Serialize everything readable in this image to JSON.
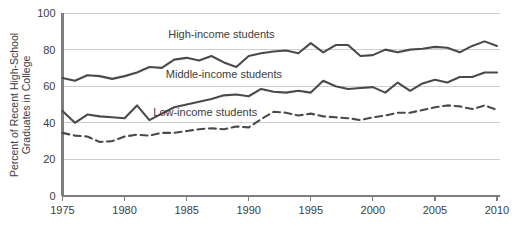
{
  "chart_data": {
    "type": "line",
    "title": "",
    "subtitle": "",
    "xlabel": "",
    "ylabel": "Percent of Recent High-School Graduates in College",
    "xlim": [
      1975,
      2010
    ],
    "ylim": [
      0,
      100
    ],
    "grid": true,
    "grid_axis": "y",
    "legend_position": "inline-annotations",
    "x_ticks": [
      1975,
      1980,
      1985,
      1990,
      1995,
      2000,
      2005,
      2010
    ],
    "x_tick_labels": [
      "1975",
      "1980",
      "1985",
      "1990",
      "1995",
      "2000",
      "2005",
      "2010"
    ],
    "y_ticks": [
      0,
      20,
      40,
      60,
      80,
      100
    ],
    "y_tick_labels": [
      "0",
      "20",
      "40",
      "60",
      "80",
      "100"
    ],
    "x": [
      1975,
      1976,
      1977,
      1978,
      1979,
      1980,
      1981,
      1982,
      1983,
      1984,
      1985,
      1986,
      1987,
      1988,
      1989,
      1990,
      1991,
      1992,
      1993,
      1994,
      1995,
      1996,
      1997,
      1998,
      1999,
      2000,
      2001,
      2002,
      2003,
      2004,
      2005,
      2006,
      2007,
      2008,
      2009,
      2010
    ],
    "series": [
      {
        "name": "High-income students",
        "label": "High-income students",
        "style": "solid",
        "color": "#4a4a4a",
        "label_x": 1987.8,
        "label_y": 88.5,
        "values": [
          64.5,
          63.0,
          66.0,
          65.5,
          64.0,
          65.5,
          67.5,
          70.5,
          70.0,
          74.5,
          75.5,
          74.0,
          76.5,
          73.0,
          70.5,
          76.5,
          78.0,
          79.0,
          79.5,
          78.0,
          83.5,
          78.5,
          82.5,
          82.5,
          76.5,
          77.0,
          80.0,
          78.5,
          80.0,
          80.5,
          81.5,
          81.0,
          78.5,
          82.0,
          84.5,
          82.0
        ]
      },
      {
        "name": "Middle-income students",
        "label": "Middle-income students",
        "style": "solid",
        "color": "#4a4a4a",
        "label_x": 1988.0,
        "label_y": 66.5,
        "values": [
          46.5,
          40.0,
          44.5,
          43.5,
          43.0,
          42.5,
          49.5,
          41.5,
          45.0,
          48.5,
          50.0,
          51.5,
          53.0,
          55.0,
          55.5,
          54.5,
          58.5,
          57.0,
          56.5,
          57.5,
          56.5,
          63.0,
          60.0,
          58.5,
          59.0,
          59.5,
          56.5,
          62.0,
          57.5,
          61.5,
          63.5,
          62.0,
          65.0,
          65.0,
          67.5,
          67.5
        ]
      },
      {
        "name": "Low-income students",
        "label": "Low-income students",
        "style": "dashed",
        "color": "#4a4a4a",
        "label_x": 1986.5,
        "label_y": 46.0,
        "values": [
          34.5,
          33.0,
          32.5,
          29.5,
          30.0,
          32.5,
          33.5,
          33.0,
          34.5,
          34.5,
          35.5,
          36.5,
          37.0,
          36.5,
          38.0,
          37.5,
          42.0,
          46.0,
          45.5,
          44.0,
          45.0,
          43.5,
          43.0,
          42.5,
          41.5,
          43.0,
          44.0,
          45.5,
          45.5,
          47.0,
          48.5,
          49.5,
          49.0,
          47.5,
          49.5,
          47.0
        ]
      }
    ]
  },
  "colors": {
    "line": "#4a4a4a",
    "grid": "#c9c9c9",
    "axis": "#7d7d7d",
    "text": "#3c3c3c",
    "background": "#ffffff"
  }
}
